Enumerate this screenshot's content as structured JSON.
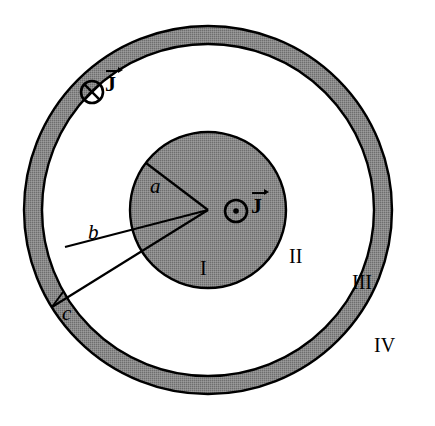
{
  "figure": {
    "background_color": "#ffffff",
    "conductor_fill_color": "#808080",
    "line_color": "#000000",
    "gap_fill_color": "#ffffff"
  },
  "geometry": {
    "center_x": 208,
    "center_y": 210,
    "inner_conductor_radius": 78,
    "shell_inner_radius": 166,
    "shell_outer_radius": 184
  },
  "radius_labels": [
    {
      "id": "a",
      "text": "a",
      "desc": "inner conductor radius",
      "x": 150,
      "y": 176
    },
    {
      "id": "b",
      "text": "b",
      "desc": "shell inner radius",
      "x": 88,
      "y": 222
    },
    {
      "id": "c",
      "text": "c",
      "desc": "shell outer radius",
      "x": 62,
      "y": 303
    }
  ],
  "region_labels": [
    {
      "id": "I",
      "text": "I",
      "desc": "inside inner conductor",
      "x": 200,
      "y": 258
    },
    {
      "id": "II",
      "text": "II",
      "desc": "gap between conductors",
      "x": 289,
      "y": 246
    },
    {
      "id": "III",
      "text": "III",
      "desc": "inside outer shell",
      "x": 352,
      "y": 272
    },
    {
      "id": "IV",
      "text": "IV",
      "desc": "outside the cable",
      "x": 374,
      "y": 335
    }
  ],
  "current_markers": [
    {
      "id": "shell-current",
      "text": "J",
      "direction": "into-page",
      "symbol": "cross-circle",
      "circle_x": 92,
      "circle_y": 92,
      "circle_r": 11,
      "label_x": 105,
      "label_y": 70
    },
    {
      "id": "core-current",
      "text": "J",
      "direction": "out-of-page",
      "symbol": "dot-circle",
      "circle_x": 236,
      "circle_y": 211,
      "circle_r": 11,
      "label_x": 251,
      "label_y": 192
    }
  ]
}
